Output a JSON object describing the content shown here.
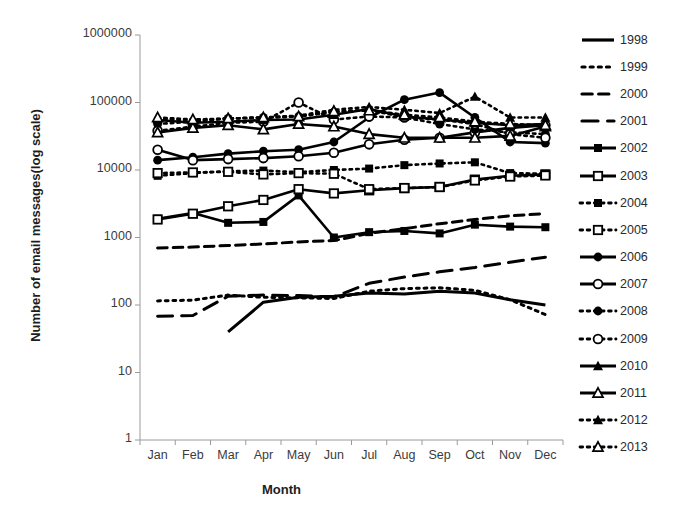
{
  "chart_data": {
    "type": "line",
    "title": "",
    "xlabel": "Month",
    "ylabel": "Number of email messages(log scale)",
    "yscale": "log",
    "ylim": [
      1,
      1000000
    ],
    "ytick_labels": [
      "1000000",
      "100000",
      "10000",
      "1000",
      "100",
      "10",
      "1"
    ],
    "ytick_values": [
      1000000,
      100000,
      10000,
      1000,
      100,
      10,
      1
    ],
    "categories": [
      "Jan",
      "Feb",
      "Mar",
      "Apr",
      "May",
      "Jun",
      "Jul",
      "Aug",
      "Sep",
      "Oct",
      "Nov",
      "Dec"
    ],
    "grid": false,
    "legend_position": "right",
    "series": [
      {
        "name": "1998",
        "style": "solid",
        "marker": "none",
        "values": [
          null,
          null,
          40,
          110,
          130,
          135,
          150,
          145,
          160,
          150,
          120,
          100
        ]
      },
      {
        "name": "1999",
        "style": "dotted",
        "marker": "none",
        "values": [
          115,
          118,
          140,
          130,
          128,
          125,
          160,
          175,
          180,
          165,
          120,
          72
        ]
      },
      {
        "name": "2000",
        "style": "dashed",
        "marker": "none",
        "values": [
          700,
          720,
          760,
          800,
          860,
          900,
          1150,
          1350,
          1600,
          1850,
          2100,
          2250
        ]
      },
      {
        "name": "2001",
        "style": "dashed-long",
        "marker": "none",
        "values": [
          68,
          70,
          135,
          140,
          138,
          132,
          210,
          260,
          310,
          360,
          430,
          510
        ]
      },
      {
        "name": "2002",
        "style": "solid",
        "marker": "square-filled",
        "values": [
          1900,
          2300,
          1650,
          1700,
          4200,
          1000,
          1200,
          1250,
          1150,
          1550,
          1450,
          1420
        ]
      },
      {
        "name": "2003",
        "style": "solid",
        "marker": "square-open",
        "values": [
          1850,
          2250,
          2900,
          3600,
          5200,
          4500,
          5000,
          5400,
          5600,
          7200,
          8200,
          8600
        ]
      },
      {
        "name": "2004",
        "style": "dotted",
        "marker": "square-filled",
        "values": [
          8200,
          9000,
          9600,
          9800,
          9300,
          10000,
          10500,
          11800,
          12500,
          13000,
          9000,
          8800
        ]
      },
      {
        "name": "2005",
        "style": "dotted",
        "marker": "square-open",
        "values": [
          9000,
          9200,
          9400,
          8600,
          9000,
          8800,
          5200,
          5400,
          5600,
          7000,
          8000,
          8300
        ]
      },
      {
        "name": "2006",
        "style": "solid",
        "marker": "circle-filled",
        "values": [
          14000,
          15500,
          17500,
          19000,
          20000,
          26000,
          60000,
          110000,
          140000,
          60000,
          26000,
          25000
        ]
      },
      {
        "name": "2007",
        "style": "solid",
        "marker": "circle-open",
        "values": [
          20000,
          14000,
          14500,
          15000,
          16000,
          18000,
          24000,
          28000,
          30000,
          36000,
          42000,
          46000
        ]
      },
      {
        "name": "2008",
        "style": "dotted",
        "marker": "circle-filled",
        "values": [
          48000,
          52000,
          58000,
          60000,
          62000,
          72000,
          78000,
          60000,
          48000,
          40000,
          36000,
          34000
        ]
      },
      {
        "name": "2009",
        "style": "dotted",
        "marker": "circle-open",
        "values": [
          38000,
          44000,
          50000,
          52000,
          100000,
          56000,
          62000,
          60000,
          56000,
          48000,
          34000,
          30000
        ]
      },
      {
        "name": "2010",
        "style": "solid",
        "marker": "triangle-filled",
        "values": [
          55000,
          50000,
          52000,
          55000,
          56000,
          66000,
          80000,
          62000,
          56000,
          50000,
          46000,
          48000
        ]
      },
      {
        "name": "2011",
        "style": "solid",
        "marker": "triangle-open",
        "values": [
          36000,
          42000,
          46000,
          40000,
          48000,
          44000,
          34000,
          30000,
          30000,
          30000,
          32000,
          44000
        ]
      },
      {
        "name": "2012",
        "style": "dotted",
        "marker": "triangle-filled",
        "values": [
          58000,
          54000,
          58000,
          60000,
          64000,
          78000,
          86000,
          78000,
          70000,
          122000,
          60000,
          60000
        ]
      },
      {
        "name": "2013",
        "style": "dotted",
        "marker": "triangle-open",
        "values": [
          60000,
          56000,
          58000,
          60000,
          62000,
          74000,
          76000,
          66000,
          60000,
          52000,
          48000,
          46000
        ]
      }
    ]
  },
  "legend": {
    "entries": [
      {
        "label": "1998",
        "style": "solid",
        "marker": "none"
      },
      {
        "label": "1999",
        "style": "dotted",
        "marker": "none"
      },
      {
        "label": "2000",
        "style": "dashed",
        "marker": "none"
      },
      {
        "label": "2001",
        "style": "dashed-long",
        "marker": "none"
      },
      {
        "label": "2002",
        "style": "solid",
        "marker": "square-filled"
      },
      {
        "label": "2003",
        "style": "solid",
        "marker": "square-open"
      },
      {
        "label": "2004",
        "style": "dotted",
        "marker": "square-filled"
      },
      {
        "label": "2005",
        "style": "dotted",
        "marker": "square-open"
      },
      {
        "label": "2006",
        "style": "solid",
        "marker": "circle-filled"
      },
      {
        "label": "2007",
        "style": "solid",
        "marker": "circle-open"
      },
      {
        "label": "2008",
        "style": "dotted",
        "marker": "circle-filled"
      },
      {
        "label": "2009",
        "style": "dotted",
        "marker": "circle-open"
      },
      {
        "label": "2010",
        "style": "solid",
        "marker": "triangle-filled"
      },
      {
        "label": "2011",
        "style": "solid",
        "marker": "triangle-open"
      },
      {
        "label": "2012",
        "style": "dotted",
        "marker": "triangle-filled"
      },
      {
        "label": "2013",
        "style": "dotted",
        "marker": "triangle-open"
      }
    ]
  },
  "colors": {
    "series": "#000000",
    "axis": "#9a9a9a",
    "text": "#2a2a2a"
  }
}
